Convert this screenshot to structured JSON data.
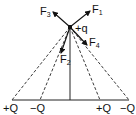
{
  "diagram": {
    "charge": {
      "label": "+q"
    },
    "forces": [
      {
        "name": "F",
        "sub": "1"
      },
      {
        "name": "F",
        "sub": "2"
      },
      {
        "name": "F",
        "sub": "3"
      },
      {
        "name": "F",
        "sub": "4"
      }
    ],
    "base_charges": [
      {
        "label": "+Q"
      },
      {
        "label": "−Q"
      },
      {
        "label": "+Q"
      },
      {
        "label": "−Q"
      }
    ]
  }
}
